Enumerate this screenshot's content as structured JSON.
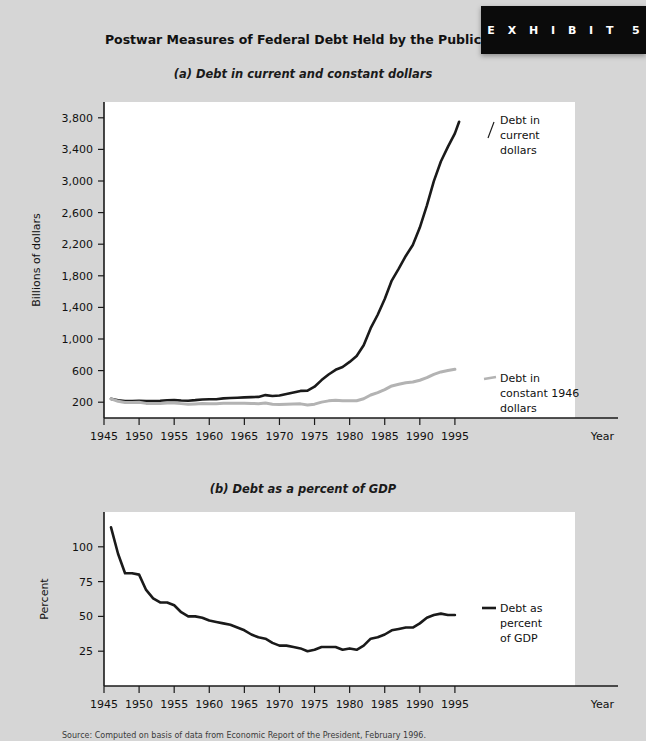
{
  "exhibit": {
    "label": "E X H I B I T",
    "number": "5"
  },
  "title": "Postwar Measures of Federal Debt Held by the Public",
  "source_note": "Source: Computed on basis of data from Economic Report of the President, February 1996.",
  "panel_a": {
    "subtitle": "(a) Debt in current and constant dollars",
    "series_label_current": "Debt in current dollars",
    "series_label_constant": "Debt in constant 1946 dollars"
  },
  "panel_b": {
    "subtitle": "(b) Debt as a percent of GDP",
    "series_label": "Debt as percent of GDP"
  },
  "chart_data": [
    {
      "type": "line",
      "title": "(a) Debt in current and constant dollars",
      "xlabel": "Year",
      "ylabel": "Billions of dollars",
      "xlim": [
        1945,
        2000
      ],
      "ylim": [
        0,
        4000
      ],
      "xticks": [
        1945,
        1950,
        1955,
        1960,
        1965,
        1970,
        1975,
        1980,
        1985,
        1990,
        1995
      ],
      "yticks": [
        200,
        600,
        1000,
        1400,
        1800,
        2200,
        2600,
        3000,
        3400,
        3800
      ],
      "ytick_labels": [
        "200",
        "600",
        "1,000",
        "1,400",
        "1,800",
        "2,200",
        "2,600",
        "3,000",
        "3,400",
        "3,800"
      ],
      "grid": false,
      "legend": "annotations",
      "x": [
        1946,
        1947,
        1948,
        1949,
        1950,
        1951,
        1952,
        1953,
        1954,
        1955,
        1956,
        1957,
        1958,
        1959,
        1960,
        1961,
        1962,
        1963,
        1964,
        1965,
        1966,
        1967,
        1968,
        1969,
        1970,
        1971,
        1972,
        1973,
        1974,
        1975,
        1976,
        1977,
        1978,
        1979,
        1980,
        1981,
        1982,
        1983,
        1984,
        1985,
        1986,
        1987,
        1988,
        1989,
        1990,
        1991,
        1992,
        1993,
        1994,
        1995
      ],
      "series": [
        {
          "name": "Debt in current dollars",
          "color": "#1a1a1a",
          "values": [
            242,
            224,
            216,
            215,
            219,
            214,
            214,
            218,
            224,
            227,
            222,
            219,
            226,
            235,
            237,
            238,
            248,
            254,
            257,
            261,
            264,
            267,
            290,
            279,
            284,
            304,
            323,
            343,
            346,
            396,
            480,
            551,
            610,
            645,
            710,
            785,
            920,
            1137,
            1307,
            1507,
            1740,
            1890,
            2051,
            2190,
            2411,
            2689,
            2999,
            3247,
            3432,
            3603
          ],
          "end_value": 3750
        },
        {
          "name": "Debt in constant 1946 dollars",
          "color": "#b3b3b3",
          "values": [
            242,
            212,
            196,
            197,
            198,
            185,
            182,
            184,
            189,
            189,
            182,
            174,
            178,
            182,
            181,
            180,
            186,
            188,
            187,
            187,
            184,
            181,
            189,
            175,
            170,
            174,
            178,
            179,
            165,
            175,
            201,
            217,
            224,
            217,
            217,
            219,
            243,
            291,
            322,
            359,
            406,
            427,
            446,
            455,
            478,
            511,
            553,
            583,
            601,
            617
          ]
        }
      ]
    },
    {
      "type": "line",
      "title": "(b) Debt as a percent of GDP",
      "xlabel": "Year",
      "ylabel": "Percent",
      "xlim": [
        1945,
        2000
      ],
      "ylim": [
        0,
        125
      ],
      "xticks": [
        1945,
        1950,
        1955,
        1960,
        1965,
        1970,
        1975,
        1980,
        1985,
        1990,
        1995
      ],
      "yticks": [
        25,
        50,
        75,
        100
      ],
      "ytick_labels": [
        "25",
        "50",
        "75",
        "100"
      ],
      "grid": false,
      "legend": "annotations",
      "x": [
        1946,
        1947,
        1948,
        1949,
        1950,
        1951,
        1952,
        1953,
        1954,
        1955,
        1956,
        1957,
        1958,
        1959,
        1960,
        1961,
        1962,
        1963,
        1964,
        1965,
        1966,
        1967,
        1968,
        1969,
        1970,
        1971,
        1972,
        1973,
        1974,
        1975,
        1976,
        1977,
        1978,
        1979,
        1980,
        1981,
        1982,
        1983,
        1984,
        1985,
        1986,
        1987,
        1988,
        1989,
        1990,
        1991,
        1992,
        1993,
        1994,
        1995
      ],
      "series": [
        {
          "name": "Debt as percent of GDP",
          "color": "#1a1a1a",
          "values": [
            114,
            95,
            81,
            81,
            80,
            69,
            63,
            60,
            60,
            58,
            53,
            50,
            50,
            49,
            47,
            46,
            45,
            44,
            42,
            40,
            37,
            35,
            34,
            31,
            29,
            29,
            28,
            27,
            25,
            26,
            28,
            28,
            28,
            26,
            27,
            26,
            29,
            34,
            35,
            37,
            40,
            41,
            42,
            42,
            45,
            49,
            51,
            52,
            51,
            51
          ]
        }
      ]
    }
  ]
}
